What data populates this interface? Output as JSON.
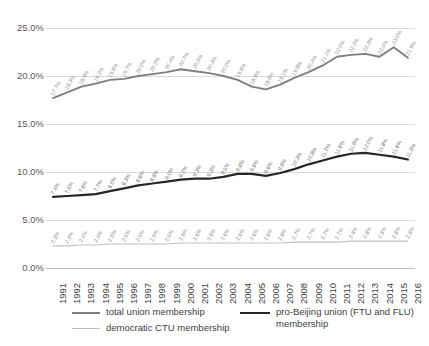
{
  "chart_data": {
    "type": "line",
    "title": "",
    "subtitle": "",
    "xlabel": "",
    "ylabel": "",
    "ylim": [
      0,
      25
    ],
    "ytick_labels": [
      "25.0%",
      "20.0%",
      "15.0%",
      "10.0%",
      "5.0%",
      "0.0%"
    ],
    "ytick_values": [
      25,
      20,
      15,
      10,
      5,
      0
    ],
    "grid": true,
    "legend_position": "bottom",
    "categories": [
      1991,
      1992,
      1993,
      1994,
      1995,
      1996,
      1997,
      1998,
      1999,
      2000,
      2001,
      2002,
      2003,
      2004,
      2005,
      2006,
      2007,
      2008,
      2009,
      2010,
      2011,
      2012,
      2013,
      2014,
      2015,
      2016
    ],
    "x_tick_labels": [
      "1991",
      "1992",
      "1993",
      "1994",
      "1995",
      "1996",
      "1997",
      "1998",
      "1999",
      "2000",
      "2001",
      "2002",
      "2003",
      "2004",
      "2005",
      "2006",
      "2007",
      "2008",
      "2009",
      "2010",
      "2011",
      "2012",
      "2013",
      "2014",
      "2015",
      "2016"
    ],
    "series": [
      {
        "name": "total union membership",
        "color": "#7f7f7f",
        "width": 1.9,
        "values": [
          17.7,
          18.3,
          18.9,
          19.2,
          19.6,
          19.7,
          20.0,
          20.2,
          20.4,
          20.7,
          20.5,
          20.3,
          20.0,
          19.6,
          18.9,
          18.6,
          19.1,
          19.8,
          20.4,
          21.1,
          22.0,
          22.2,
          22.3,
          22.0,
          23.0,
          21.9
        ],
        "labels": [
          "17.7%",
          "18.3%",
          "18.9%",
          "19.2%",
          "19.6%",
          "19.7%",
          "20.0%",
          "20.2%",
          "20.4%",
          "20.7%",
          "20.5%",
          "20.3%",
          "20.0%",
          "19.6%",
          "18.9%",
          "18.6%",
          "19.1%",
          "19.8%",
          "20.4%",
          "21.1%",
          "22.0%",
          "22.2%",
          "22.3%",
          "22.0%",
          "23.0%",
          "21.9%"
        ]
      },
      {
        "name": "pro-Beijing union (FTU and FLU) membership",
        "color": "#262626",
        "width": 2.2,
        "values": [
          7.4,
          7.5,
          7.6,
          7.7,
          8.0,
          8.3,
          8.6,
          8.8,
          9.0,
          9.2,
          9.3,
          9.3,
          9.5,
          9.8,
          9.8,
          9.6,
          9.9,
          10.3,
          10.8,
          11.2,
          11.6,
          11.9,
          12.0,
          11.8,
          11.6,
          11.3
        ],
        "labels": [
          "7.4%",
          "7.5%",
          "7.6%",
          "7.7%",
          "8.0%",
          "8.3%",
          "8.6%",
          "8.8%",
          "9.0%",
          "9.2%",
          "9.3%",
          "9.3%",
          "9.5%",
          "9.8%",
          "9.8%",
          "9.6%",
          "9.9%",
          "10.3%",
          "10.8%",
          "11.2%",
          "11.6%",
          "11.9%",
          "12.0%",
          "11.8%",
          "11.6%",
          "11.3%"
        ]
      },
      {
        "name": "democratic CTU membership",
        "color": "#bfbfbf",
        "width": 1.1,
        "values": [
          2.3,
          2.3,
          2.4,
          2.4,
          2.5,
          2.5,
          2.5,
          2.5,
          2.5,
          2.6,
          2.6,
          2.6,
          2.6,
          2.6,
          2.6,
          2.6,
          2.6,
          2.7,
          2.7,
          2.7,
          2.7,
          2.8,
          2.8,
          2.8,
          2.8,
          2.8
        ],
        "labels": [
          "2.3%",
          "2.3%",
          "2.4%",
          "2.4%",
          "2.5%",
          "2.5%",
          "2.5%",
          "2.5%",
          "2.5%",
          "2.6%",
          "2.6%",
          "2.6%",
          "2.6%",
          "2.6%",
          "2.6%",
          "2.6%",
          "2.6%",
          "2.7%",
          "2.7%",
          "2.7%",
          "2.7%",
          "2.8%",
          "2.8%",
          "2.8%",
          "2.8%",
          "2.8%"
        ]
      }
    ]
  },
  "legend": {
    "items": [
      {
        "label": "total union membership",
        "color": "#7f7f7f",
        "width": 2
      },
      {
        "label": "democratic CTU membership",
        "color": "#bfbfbf",
        "width": 1.3
      },
      {
        "label": "pro-Beijing union (FTU and FLU)\nmembership",
        "color": "#262626",
        "width": 2.4
      }
    ]
  }
}
